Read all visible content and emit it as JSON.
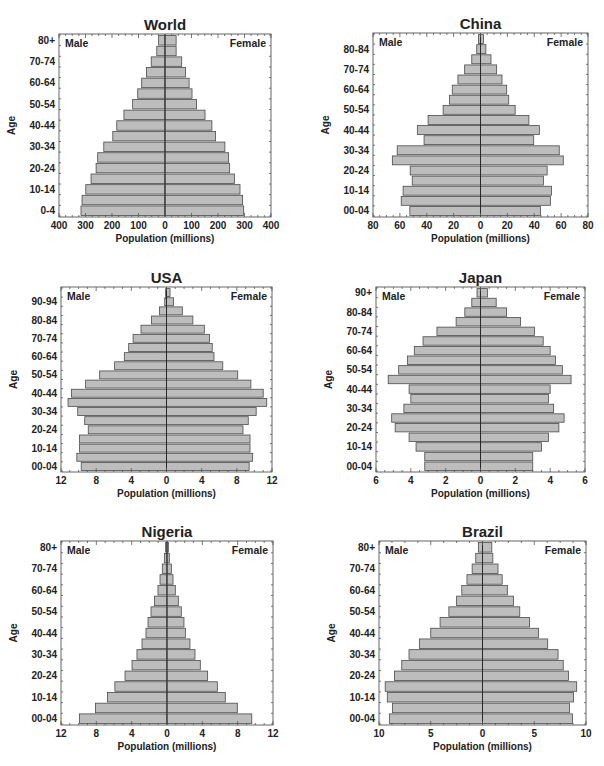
{
  "chart_data": [
    {
      "type": "bar",
      "orientation": "population-pyramid",
      "title": "World",
      "xlabel": "Population (millions)",
      "ylabel": "Age",
      "left_label": "Male",
      "right_label": "Female",
      "xlim": [
        -400,
        400
      ],
      "xticks": [
        -400,
        -300,
        -200,
        -100,
        0,
        100,
        200,
        300,
        400
      ],
      "xtick_labels": [
        "400",
        "300",
        "200",
        "100",
        "0",
        "100",
        "200",
        "300",
        "400"
      ],
      "categories": [
        "0-4",
        "5-9",
        "10-14",
        "15-19",
        "20-24",
        "25-29",
        "30-34",
        "35-39",
        "40-44",
        "45-49",
        "50-54",
        "55-59",
        "60-64",
        "65-69",
        "70-74",
        "75-79",
        "80+"
      ],
      "ytick_labels": [
        "0-4",
        "10-14",
        "20-24",
        "30-34",
        "40-44",
        "50-54",
        "60-64",
        "70-74",
        "80+"
      ],
      "series": [
        {
          "name": "Male",
          "values": [
            317,
            313,
            299,
            279,
            260,
            254,
            231,
            197,
            182,
            155,
            122,
            103,
            88,
            70,
            52,
            31,
            24
          ]
        },
        {
          "name": "Female",
          "values": [
            297,
            293,
            283,
            262,
            244,
            240,
            226,
            191,
            177,
            151,
            119,
            102,
            91,
            77,
            63,
            42,
            42
          ]
        }
      ]
    },
    {
      "type": "bar",
      "orientation": "population-pyramid",
      "title": "China",
      "xlabel": "Population (millions)",
      "ylabel": "Age",
      "left_label": "Male",
      "right_label": "Female",
      "xlim": [
        -80,
        80
      ],
      "xticks": [
        -80,
        -60,
        -40,
        -20,
        0,
        20,
        40,
        60,
        80
      ],
      "xtick_labels": [
        "80",
        "60",
        "40",
        "20",
        "0",
        "20",
        "40",
        "60",
        "80"
      ],
      "categories": [
        "00-04",
        "05-09",
        "10-14",
        "15-19",
        "20-24",
        "25-29",
        "30-34",
        "35-39",
        "40-44",
        "45-49",
        "50-54",
        "55-59",
        "60-64",
        "65-69",
        "70-74",
        "75-79",
        "80-84",
        "85+"
      ],
      "ytick_labels": [
        "00-04",
        "10-14",
        "20-24",
        "30-34",
        "40-44",
        "50-54",
        "60-64",
        "70-74",
        "80-84"
      ],
      "series": [
        {
          "name": "Male",
          "values": [
            52.6,
            59,
            57.6,
            50.8,
            52.3,
            65.6,
            62,
            42,
            47,
            39,
            27.8,
            23,
            21,
            16.8,
            11.8,
            6.5,
            2.8,
            1.5
          ]
        },
        {
          "name": "Female",
          "values": [
            44.6,
            52,
            52.8,
            46.8,
            49.6,
            61.6,
            58.6,
            39.6,
            43.8,
            36,
            25.8,
            21,
            19.5,
            16,
            12,
            7.8,
            4,
            2.3
          ]
        }
      ]
    },
    {
      "type": "bar",
      "orientation": "population-pyramid",
      "title": "USA",
      "xlabel": "Population (millions)",
      "ylabel": "Age",
      "left_label": "Male",
      "right_label": "Female",
      "xlim": [
        -12,
        12
      ],
      "xticks": [
        -12,
        -8,
        -4,
        0,
        4,
        8,
        12
      ],
      "xtick_labels": [
        "12",
        "8",
        "4",
        "0",
        "4",
        "8",
        "12"
      ],
      "categories": [
        "00-04",
        "05-09",
        "10-14",
        "15-19",
        "20-24",
        "25-29",
        "30-34",
        "35-39",
        "40-44",
        "45-49",
        "50-54",
        "55-59",
        "60-64",
        "65-69",
        "70-74",
        "75-79",
        "80-84",
        "85-89",
        "90-94",
        "95+"
      ],
      "ytick_labels": [
        "00-04",
        "10-14",
        "20-24",
        "30-34",
        "40-44",
        "50-54",
        "60-64",
        "70-74",
        "80-84",
        "90-94"
      ],
      "series": [
        {
          "name": "Male",
          "values": [
            9.7,
            10.2,
            9.9,
            9.9,
            8.9,
            9.3,
            10.1,
            11.2,
            10.8,
            9.2,
            7.6,
            5.9,
            4.8,
            4.3,
            3.8,
            2.9,
            1.7,
            0.8,
            0.2,
            0.1
          ]
        },
        {
          "name": "Female",
          "values": [
            9.4,
            9.8,
            9.5,
            9.5,
            8.7,
            9.3,
            10.2,
            11.4,
            11.0,
            9.6,
            8.1,
            6.4,
            5.4,
            5.2,
            4.9,
            4.3,
            3.0,
            1.8,
            0.8,
            0.4
          ]
        }
      ]
    },
    {
      "type": "bar",
      "orientation": "population-pyramid",
      "title": "Japan",
      "xlabel": "Population (millions)",
      "ylabel": "Age",
      "left_label": "Male",
      "right_label": "Female",
      "xlim": [
        -6,
        6
      ],
      "xticks": [
        -6,
        -4,
        -2,
        0,
        2,
        4,
        6
      ],
      "xtick_labels": [
        "6",
        "4",
        "2",
        "0",
        "2",
        "4",
        "6"
      ],
      "categories": [
        "00-04",
        "05-09",
        "10-14",
        "15-19",
        "20-24",
        "25-29",
        "30-34",
        "35-39",
        "40-44",
        "45-49",
        "50-54",
        "55-59",
        "60-64",
        "65-69",
        "70-74",
        "75-79",
        "80-84",
        "85-89",
        "90+"
      ],
      "ytick_labels": [
        "00-04",
        "10-14",
        "20-24",
        "30-34",
        "40-44",
        "50-54",
        "60-64",
        "70-74",
        "80-84",
        "90+"
      ],
      "series": [
        {
          "name": "Male",
          "values": [
            3.2,
            3.2,
            3.7,
            4.1,
            4.9,
            5.1,
            4.4,
            4.0,
            4.1,
            5.3,
            4.7,
            4.2,
            3.8,
            3.3,
            2.5,
            1.4,
            0.9,
            0.5,
            0.2
          ]
        },
        {
          "name": "Female",
          "values": [
            3.0,
            3.0,
            3.5,
            3.9,
            4.5,
            4.8,
            4.2,
            3.9,
            4.0,
            5.2,
            4.7,
            4.3,
            4.0,
            3.6,
            3.1,
            2.3,
            1.5,
            0.9,
            0.4
          ]
        }
      ]
    },
    {
      "type": "bar",
      "orientation": "population-pyramid",
      "title": "Nigeria",
      "xlabel": "Population (millions)",
      "ylabel": "Age",
      "left_label": "Male",
      "right_label": "Female",
      "xlim": [
        -12,
        12
      ],
      "xticks": [
        -12,
        -8,
        -4,
        0,
        4,
        8,
        12
      ],
      "xtick_labels": [
        "12",
        "8",
        "4",
        "0",
        "4",
        "8",
        "12"
      ],
      "categories": [
        "00-04",
        "05-09",
        "10-14",
        "15-19",
        "20-24",
        "25-29",
        "30-34",
        "35-39",
        "40-44",
        "45-49",
        "50-54",
        "55-59",
        "60-64",
        "65-69",
        "70-74",
        "75-79",
        "80+"
      ],
      "ytick_labels": [
        "00-04",
        "10-14",
        "20-24",
        "30-34",
        "40-44",
        "50-54",
        "60-64",
        "70-74",
        "80+"
      ],
      "series": [
        {
          "name": "Male",
          "values": [
            9.9,
            8.1,
            6.75,
            5.9,
            4.75,
            3.96,
            3.4,
            2.83,
            2.38,
            2.15,
            1.81,
            1.43,
            1.02,
            0.79,
            0.53,
            0.3,
            0.15
          ]
        },
        {
          "name": "Female",
          "values": [
            9.6,
            7.96,
            6.6,
            5.7,
            4.6,
            3.77,
            3.17,
            2.6,
            2.08,
            1.92,
            1.62,
            1.28,
            0.94,
            0.68,
            0.49,
            0.26,
            0.15
          ]
        }
      ]
    },
    {
      "type": "bar",
      "orientation": "population-pyramid",
      "title": "Brazil",
      "xlabel": "Population (millions)",
      "ylabel": "Age",
      "left_label": "Male",
      "right_label": "Female",
      "xlim": [
        -10,
        10
      ],
      "xticks": [
        -10,
        -5,
        0,
        5,
        10
      ],
      "xtick_labels": [
        "10",
        "5",
        "0",
        "5",
        "10"
      ],
      "categories": [
        "00-04",
        "05-09",
        "10-14",
        "15-19",
        "20-24",
        "25-29",
        "30-34",
        "35-39",
        "40-44",
        "45-49",
        "50-54",
        "55-59",
        "60-64",
        "65-69",
        "70-74",
        "75-79",
        "80+"
      ],
      "ytick_labels": [
        "00-04",
        "10-14",
        "20-24",
        "30-34",
        "40-44",
        "50-54",
        "60-64",
        "70-74",
        "80+"
      ],
      "series": [
        {
          "name": "Male",
          "values": [
            9.0,
            8.7,
            9.2,
            9.4,
            8.5,
            7.8,
            7.1,
            6.1,
            5.0,
            4.1,
            3.25,
            2.5,
            2.0,
            1.5,
            1.0,
            0.65,
            0.4
          ]
        },
        {
          "name": "Female",
          "values": [
            8.7,
            8.4,
            8.8,
            9.1,
            8.3,
            7.8,
            7.3,
            6.3,
            5.4,
            4.55,
            3.6,
            3.0,
            2.4,
            1.9,
            1.5,
            1.0,
            0.9
          ]
        }
      ]
    }
  ]
}
